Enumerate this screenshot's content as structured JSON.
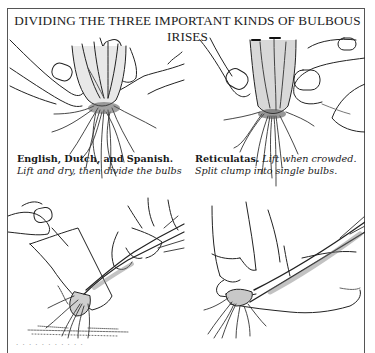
{
  "title": "DIVIDING THE THREE IMPORTANT KINDS OF BULBOUS IRISES",
  "panels": [
    {
      "id": "top-left",
      "illustration": "hands-dividing-bulb-cluster",
      "caption_bold": "English, Dutch, and Spanish.",
      "caption_italic": "Lift and dry, then divide the bulbs"
    },
    {
      "id": "top-right",
      "illustration": "hands-splitting-reticulata-clump",
      "caption_bold": "Reticulatas.",
      "caption_italic_1": "Lift when crowded.",
      "caption_italic_2": "Split clump into single bulbs."
    },
    {
      "id": "bottom-left",
      "illustration": "spade-lifting-iris-clump"
    },
    {
      "id": "bottom-right",
      "illustration": "hands-pulling-apart-rhizome-roots"
    }
  ],
  "bottom_caption_partial": "· · · · · · · · · · ·"
}
